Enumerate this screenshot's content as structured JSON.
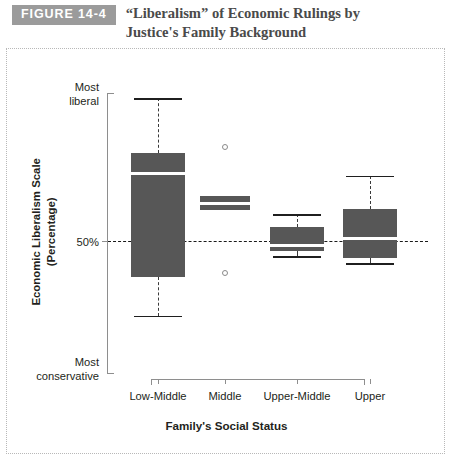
{
  "header": {
    "badge": "FIGURE 14-4",
    "title": "“Liberalism” of Economic Rulings by Justice's Family Background"
  },
  "axes": {
    "y_title": "Economic Liberalism Scale\n(Percentage)",
    "y_label_top": "Most\nliberal",
    "y_label_mid": "50%",
    "y_label_bottom": "Most\nconservative",
    "x_title": "Family's Social Status"
  },
  "chart_data": {
    "type": "box",
    "title": "“Liberalism” of Economic Rulings by Justice's Family Background",
    "xlabel": "Family's Social Status",
    "ylabel": "Economic Liberalism Scale (Percentage)",
    "ylim": [
      0,
      100
    ],
    "yticks": [
      {
        "value": 100,
        "label": "Most liberal"
      },
      {
        "value": 50,
        "label": "50%"
      },
      {
        "value": 0,
        "label": "Most conservative"
      }
    ],
    "reference_line": {
      "value": 50,
      "label": "50%",
      "style": "dashed"
    },
    "grid": false,
    "legend": false,
    "categories": [
      "Low-Middle",
      "Middle",
      "Upper-Middle",
      "Upper"
    ],
    "boxes": [
      {
        "category": "Low-Middle",
        "whisker_low": 20.4,
        "q1": 34.3,
        "median": 71.1,
        "q3": 78.6,
        "whisker_high": 98.2,
        "outliers": []
      },
      {
        "category": "Middle",
        "whisker_low": 61.1,
        "q1": 58.2,
        "median": 60.7,
        "q3": 63.2,
        "whisker_high": 63.2,
        "outliers": [
          80.7,
          35.7
        ]
      },
      {
        "category": "Upper-Middle",
        "whisker_low": 41.8,
        "q1": 43.6,
        "median": 45.4,
        "q3": 52.1,
        "whisker_high": 56.8,
        "outliers": []
      },
      {
        "category": "Upper",
        "whisker_low": 39.3,
        "q1": 41.1,
        "median": 48.2,
        "q3": 58.6,
        "whisker_high": 70.4,
        "outliers": []
      }
    ]
  },
  "colors": {
    "box_fill": "#575757",
    "median": "#ffffff",
    "axis": "#8e8e8e",
    "reference_line": "#1a1a1a",
    "badge_background": "#9b9b9b",
    "title_text": "#4a4a4a",
    "frame_border": "#b8b8b8"
  }
}
